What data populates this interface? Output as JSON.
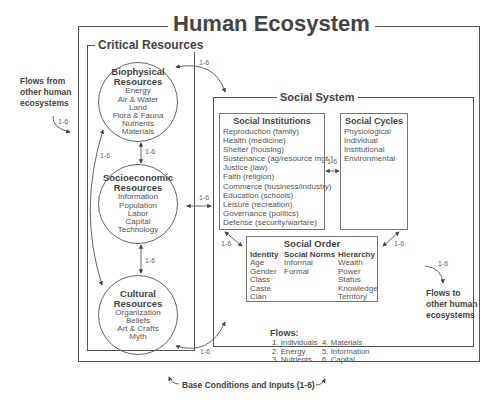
{
  "title": "Human Ecosystem",
  "critical_resources": {
    "title": "Critical Resources",
    "biophysical": {
      "title_line1": "Biophysical",
      "title_line2": "Resources",
      "items": [
        "Energy",
        "Air & Water",
        "Land",
        "Flora & Fauna",
        "Nutrients",
        "Materials"
      ]
    },
    "socioeconomic": {
      "title_line1": "Socioeconomic",
      "title_line2": "Resources",
      "items": [
        "Information",
        "Population",
        "Labor",
        "Capital",
        "Technology"
      ]
    },
    "cultural": {
      "title_line1": "Cultural",
      "title_line2": "Resources",
      "items": [
        "Organization",
        "Beliefs",
        "Art & Crafts",
        "Myth"
      ]
    }
  },
  "social_system": {
    "title": "Social System",
    "institutions": {
      "title": "Social Institutions",
      "items": [
        "Reproduction (family)",
        "Health (medicine)",
        "Shelter (housing)",
        "Sustenance (ag/resource mgt.)",
        "Justice (law)",
        "Faith (religion)",
        "Commerce (business/industry)",
        "Education (schools)",
        "Leisure (recreation)",
        "Governance (politics)",
        "Defense (security/warfare)"
      ]
    },
    "cycles": {
      "title": "Social Cycles",
      "items": [
        "Physiological",
        "Individual",
        "Institutional",
        "Environmental"
      ]
    },
    "order": {
      "title": "Social Order",
      "columns": [
        {
          "header": "Identity",
          "items": [
            "Age",
            "Gender",
            "Class",
            "Caste",
            "Clan"
          ]
        },
        {
          "header": "Social Norms",
          "items": [
            "Informal",
            "Formal"
          ]
        },
        {
          "header": "Hierarchy",
          "items": [
            "Wealth",
            "Power",
            "Status",
            "Knowledge",
            "Territory"
          ]
        }
      ]
    }
  },
  "flow_label": "1-6",
  "flows_from": {
    "line1": "Flows from",
    "line2": "other human",
    "line3": "ecosystems"
  },
  "flows_to": {
    "line1": "Flows to",
    "line2": "other human",
    "line3": "ecosystems"
  },
  "flows_legend": {
    "title": "Flows:",
    "col1": [
      "1. Individuals",
      "2. Energy",
      "3. Nutrients"
    ],
    "col2": [
      "4. Materials",
      "5. Information",
      "6. Capital"
    ]
  },
  "base_conditions": "Base Conditions and Inputs (1-6)"
}
